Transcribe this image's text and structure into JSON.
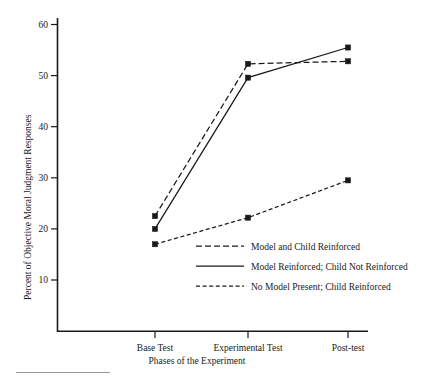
{
  "figure": {
    "title": "",
    "background_color": "#ffffff",
    "ink_color": "#1a1a1a"
  },
  "axes": {
    "y_title": "Percent of Objective Moral Judgment Responses",
    "x_title": "Phases of the Experiment",
    "y_ticks": [
      "10",
      "20",
      "30",
      "40",
      "50",
      "60"
    ],
    "x_ticks": [
      "Base Test",
      "Experimental Test",
      "Post-test"
    ]
  },
  "legend": {
    "entries": [
      {
        "label": "Model and Child Reinforced",
        "style": "long-dashed"
      },
      {
        "label": "Model Reinforced; Child Not Reinforced",
        "style": "solid"
      },
      {
        "label": "No Model Present; Child Reinforced",
        "style": "short-dashed"
      }
    ]
  },
  "chart_data": {
    "type": "line",
    "title": "",
    "xlabel": "Phases of the Experiment",
    "ylabel": "Percent of Objective Moral Judgment Responses",
    "categories": [
      "Base Test",
      "Experimental Test",
      "Post-test"
    ],
    "ylim": [
      0,
      62
    ],
    "yticks": [
      10,
      20,
      30,
      40,
      50,
      60
    ],
    "grid": false,
    "legend_position": "inside-lower-center",
    "markers": "filled-square",
    "series": [
      {
        "name": "Model and Child Reinforced",
        "style": "long-dashed",
        "values": [
          22.5,
          52.3,
          52.8
        ]
      },
      {
        "name": "Model Reinforced; Child Not Reinforced",
        "style": "solid",
        "values": [
          20.0,
          49.6,
          55.5
        ]
      },
      {
        "name": "No Model Present; Child Reinforced",
        "style": "short-dashed",
        "values": [
          17.0,
          22.2,
          29.5
        ]
      }
    ]
  }
}
